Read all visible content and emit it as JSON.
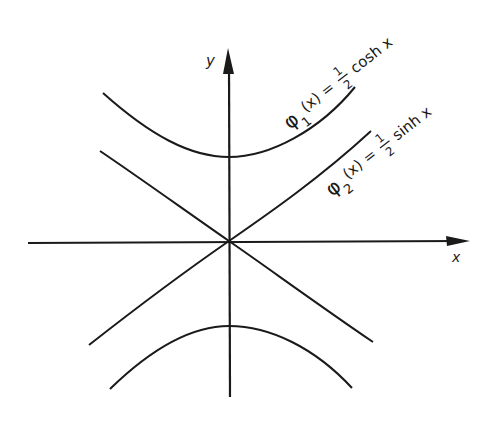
{
  "figure": {
    "axes": {
      "x_label": "x",
      "y_label": "y"
    },
    "curves": [
      {
        "id": "phi1",
        "label_func": "φ",
        "label_sub": "1",
        "label_arg": "(x) =",
        "label_num": "1",
        "label_den": "2",
        "label_rest": "cosh x",
        "expression": "φ1(x) = 1/2 cosh x"
      },
      {
        "id": "phi2",
        "label_func": "φ",
        "label_sub": "2",
        "label_arg": "(x) =",
        "label_num": "1",
        "label_den": "2",
        "label_rest": "sinh x",
        "expression": "φ2(x) = 1/2 sinh x"
      }
    ],
    "colors": {
      "ink": "#1a1a1a",
      "background": "#ffffff"
    }
  }
}
